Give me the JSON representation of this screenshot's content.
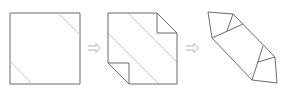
{
  "diagram": {
    "title": "",
    "type": "origami-folding-steps",
    "colors": {
      "outline": "#6b6b6b",
      "crease": "#c8c8c8",
      "arrow": "#a8a8a8",
      "background": "#ffffff"
    },
    "steps": [
      {
        "id": "step-1",
        "description": "square sheet with two diagonal crease lines at opposite corners",
        "outline": [
          [
            10,
            13
          ],
          [
            80,
            13
          ],
          [
            80,
            84
          ],
          [
            10,
            84
          ]
        ],
        "creases": [
          [
            [
              58,
              13
            ],
            [
              80,
              35
            ]
          ],
          [
            [
              10,
              61
            ],
            [
              32,
              84
            ]
          ]
        ]
      },
      {
        "id": "step-2",
        "description": "square with top-right and bottom-left corners folded inward, two long diagonal creases",
        "outline": [
          [
            108,
            13
          ],
          [
            157,
            13
          ],
          [
            177,
            33
          ],
          [
            177,
            84
          ],
          [
            129,
            84
          ],
          [
            108,
            63
          ]
        ],
        "folds": [
          [
            [
              157,
              13
            ],
            [
              157,
              33
            ],
            [
              177,
              33
            ]
          ],
          [
            [
              108,
              63
            ],
            [
              129,
              63
            ],
            [
              129,
              84
            ]
          ]
        ],
        "creases": [
          [
            [
              128,
              13
            ],
            [
              177,
              62
            ]
          ],
          [
            [
              108,
              33
            ],
            [
              159,
              84
            ]
          ]
        ]
      },
      {
        "id": "step-3",
        "description": "elongated hexagonal shape with folded triangular flaps at both ends",
        "outline": [
          [
            208,
            12
          ],
          [
            233,
            14
          ],
          [
            275,
            57
          ],
          [
            277,
            83
          ],
          [
            252,
            80
          ],
          [
            212,
            38
          ]
        ],
        "lines": [
          [
            [
              212,
              38
            ],
            [
              243,
              24
            ]
          ],
          [
            [
              233,
              14
            ],
            [
              227,
              30
            ]
          ],
          [
            [
              252,
              80
            ],
            [
              258,
              62
            ]
          ],
          [
            [
              258,
              62
            ],
            [
              275,
              57
            ]
          ],
          [
            [
              263,
              46
            ],
            [
              258,
              62
            ]
          ]
        ]
      }
    ],
    "arrows": [
      {
        "id": "arrow-1",
        "from": [
          88,
          48
        ],
        "to": [
          100,
          48
        ],
        "symbol": "⇨"
      },
      {
        "id": "arrow-2",
        "from": [
          186,
          48
        ],
        "to": [
          198,
          48
        ],
        "symbol": "⇨"
      }
    ]
  }
}
